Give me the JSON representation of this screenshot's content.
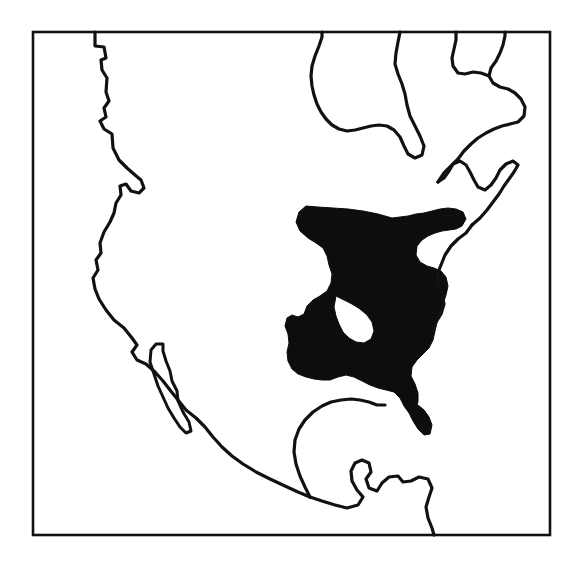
{
  "figure": {
    "kind": "distribution-range-map",
    "region": "North America",
    "caption": "",
    "background_color": "#ffffff",
    "outline_color": "#111111",
    "range_fill_color": "#0d0d0d",
    "frame": {
      "label": "map-border",
      "x": 33,
      "y": 32,
      "width": 517,
      "height": 503,
      "stroke_width": 2.6
    },
    "layers": [
      {
        "name": "coastline",
        "label": "North American coastline",
        "stroke_width": 3.2,
        "fill": "none"
      },
      {
        "name": "baja-peninsula",
        "label": "Baja California peninsula",
        "stroke_width": 3.0,
        "fill": "none"
      },
      {
        "name": "species-range",
        "label": "Shaded distribution range (eastern North America)",
        "stroke_width": 0,
        "fill": "#0d0d0d"
      }
    ],
    "geometry": {
      "pacific_coast": "M 95 32 L 95 46 L 104 47 L 106 58 L 101 60 L 102 70 L 107 78 L 106 92 L 109 101 L 104 108 L 106 117 L 100 121 L 104 129 L 112 134 L 113 148 L 119 160 L 127 168 L 135 175 L 141 180 L 144 188 L 139 193 L 131 191 L 126 184 L 120 186 L 121 195 L 116 203 L 114 213 L 110 222 L 104 232 L 100 243 L 101 253 L 96 260 L 98 270 L 93 278 L 95 289 L 99 299 L 106 310 L 114 320 L 124 328 L 132 338 L 137 345 L 132 352 L 137 360 L 146 364 L 155 372 L 163 381 L 170 390 L 178 400 L 186 410 L 196 418 L 205 427 L 213 437 L 222 447 L 232 456 L 243 464 L 256 472 L 270 479 L 285 486 L 298 492 L 310 497",
      "baja_outline": "M 156 344 L 151 350 L 150 362 L 154 374 L 158 386 L 163 397 L 168 408 L 174 418 L 180 427 L 186 433 L 191 431 L 189 422 L 183 412 L 178 401 L 177 391 L 172 381 L 170 371 L 166 361 L 163 351 L 163 344 Z",
      "gulf_and_yucatan": "M 310 497 L 322 501 L 335 505 L 347 508 L 358 505 L 363 497 L 357 490 L 352 481 L 351 471 L 355 463 L 362 460 L 369 463 L 371 472 L 366 479 L 369 488 L 377 491 L 382 483 L 389 477 L 398 476 L 403 482 L 411 481 L 419 477 L 428 479 L 432 488 L 429 497 L 426 507 L 428 518 L 432 528 L 434 535",
      "gulf_north_shore": "M 310 497 L 305 487 L 300 476 L 296 464 L 294 452 L 295 440 L 299 429 L 305 420 L 313 412 L 322 406 L 331 402 L 341 400 L 351 399 L 360 400 L 369 402 L 377 405 L 385 405",
      "east_coast": "M 472 225 L 466 233 L 458 239 L 451 246 L 445 255 L 441 265 L 437 275 L 438 285 L 442 294 L 444 304 L 441 314 L 436 322 L 433 332",
      "st_lawrence_nova_scotia": "M 472 225 L 480 218 L 487 210 L 493 202 L 499 194 L 504 186 L 509 179 L 514 172 L 518 165 L 513 161 L 506 164 L 500 170 L 496 178 L 491 185 L 485 190 L 478 187 L 474 180 L 470 172 L 466 165 L 460 161 L 453 164 L 449 171 L 444 178 L 438 182",
      "northeast_canada": "M 438 182 L 444 173 L 451 166 L 458 159 L 464 151 L 471 144 L 478 138 L 486 133 L 494 129 L 502 126 L 510 124 L 518 122 L 524 116 L 525 107 L 521 99 L 515 93 L 508 89 L 500 87 L 493 83 L 489 76 L 491 68 L 496 61 L 500 53 L 503 45 L 505 36 L 505 32",
      "hudson_bay_east": "M 489 76 L 481 73 L 473 72 L 465 74 L 458 73 L 453 66 L 452 58 L 454 49 L 456 40 L 456 32",
      "hudson_bay_west": "M 400 32 L 398 42 L 396 53 L 395 64 L 398 74 L 402 84 L 405 94 L 407 105 L 410 116 L 415 126 L 420 136 L 424 146 L 422 155 L 415 158 L 408 154 L 404 146 L 400 137 L 394 130 L 387 126 L 379 125 L 371 126 L 363 128 L 355 130 L 347 131 L 339 129 L 332 125 L 326 119 L 321 112 L 317 104 L 314 95 L 312 86 L 311 76 L 312 66 L 315 56 L 319 46 L 322 37 L 322 32",
      "range_main": "M 392 218 L 378 214 L 363 211 L 348 209 L 333 208 L 318 207 L 306 206 L 299 212 L 296 222 L 300 231 L 308 238 L 316 243 L 323 248 L 327 256 L 329 265 L 332 274 L 331 283 L 327 291 L 320 296 L 313 300 L 307 306 L 304 314 L 298 317 L 292 315 L 287 318 L 285 326 L 288 334 L 289 343 L 287 352 L 288 361 L 292 369 L 298 374 L 306 377 L 314 379 L 322 380 L 330 380 L 338 377 L 346 375 L 354 377 L 362 381 L 370 385 L 378 388 L 386 390 L 394 392 L 400 398 L 404 406 L 409 413 L 415 410 L 418 402 L 418 393 L 415 384 L 411 376 L 412 367 L 417 360 L 423 354 L 429 348 L 433 340 L 435 331 L 437 322 L 440 313 L 443 304 L 446 295 L 448 286 L 446 277 L 441 271 L 434 268 L 427 266 L 420 262 L 416 255 L 417 246 L 422 240 L 428 236 L 435 233 L 442 231 L 449 230 L 456 229 L 462 226 L 466 219 L 463 212 L 456 209 L 448 208 L 440 209 L 432 211 L 424 213 L 416 214 L 408 216 Z",
      "range_hole": "M 336 296 L 344 300 L 352 304 L 360 309 L 367 315 L 372 322 L 374 331 L 371 339 L 364 343 L 356 342 L 349 338 L 343 332 L 339 324 L 336 316 L 334 307 Z",
      "range_tail": "M 409 413 L 413 421 L 418 429 L 424 435 L 430 434 L 432 425 L 429 417 L 424 410 L 418 405 L 412 406 Z"
    }
  }
}
